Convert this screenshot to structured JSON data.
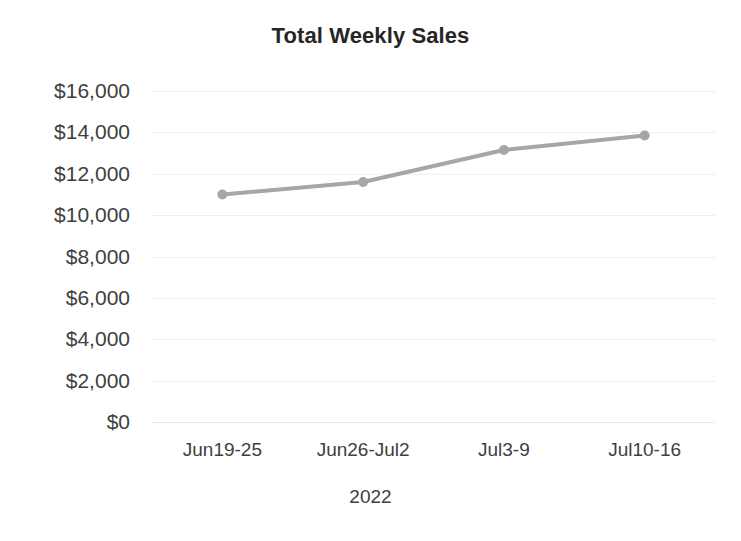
{
  "chart_data": {
    "type": "line",
    "title": "Total Weekly Sales",
    "xlabel": "2022",
    "ylabel": "",
    "categories": [
      "Jun19-25",
      "Jun26-Jul2",
      "Jul3-9",
      "Jul10-16"
    ],
    "values": [
      11000,
      11600,
      13150,
      13850
    ],
    "series": [
      {
        "name": "Total Weekly Sales",
        "values": [
          11000,
          11600,
          13150,
          13850
        ]
      }
    ],
    "ylim": [
      0,
      16000
    ],
    "yticks": [
      0,
      2000,
      4000,
      6000,
      8000,
      10000,
      12000,
      14000,
      16000
    ],
    "ytick_labels": [
      "$0",
      "$2,000",
      "$4,000",
      "$6,000",
      "$8,000",
      "$10,000",
      "$12,000",
      "$14,000",
      "$16,000"
    ],
    "grid": true,
    "legend": false,
    "legend_position": "none",
    "colors": {
      "line": "#a6a6a6",
      "marker": "#a6a6a6",
      "gridline": "#efefef",
      "title_text": "#262626",
      "axis_text": "#404040",
      "background": "#ffffff"
    },
    "line_width": 4,
    "marker_size": 5,
    "marker_shape": "circle"
  }
}
